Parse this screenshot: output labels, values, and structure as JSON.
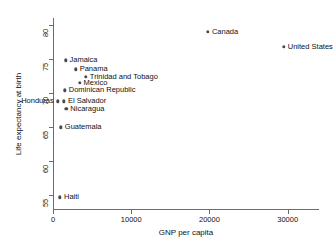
{
  "chart_data": {
    "type": "scatter",
    "title": "",
    "xlabel": "GNP per capita",
    "ylabel": "Life expectancy at birth",
    "xlim": [
      0,
      34000
    ],
    "ylim": [
      53,
      81
    ],
    "grid": false,
    "legend": "none",
    "xticks": [
      {
        "value": 0,
        "label": "0"
      },
      {
        "value": 10000,
        "label": "10000"
      },
      {
        "value": 20000,
        "label": "20000"
      },
      {
        "value": 30000,
        "label": "30000"
      }
    ],
    "yticks": [
      {
        "value": 55,
        "label": "55"
      },
      {
        "value": 60,
        "label": "60"
      },
      {
        "value": 65,
        "label": "65"
      },
      {
        "value": 70,
        "label": "70"
      },
      {
        "value": 75,
        "label": "75"
      },
      {
        "value": 80,
        "label": "80"
      }
    ],
    "points": [
      {
        "label": "Canada",
        "x": 19800,
        "y": 79.0,
        "label_side": "right"
      },
      {
        "label": "United States",
        "x": 29500,
        "y": 76.8,
        "label_side": "right"
      },
      {
        "label": "Jamaica",
        "x": 1600,
        "y": 74.8,
        "label_side": "right"
      },
      {
        "label": "Panama",
        "x": 2900,
        "y": 73.5,
        "label_side": "right"
      },
      {
        "label": "Trinidad and Tobago",
        "x": 4200,
        "y": 72.4,
        "label_side": "right"
      },
      {
        "label": "Mexico",
        "x": 3400,
        "y": 71.5,
        "label_side": "right"
      },
      {
        "label": "Dominican Republic",
        "x": 1500,
        "y": 70.4,
        "label_side": "right"
      },
      {
        "label": "Honduras",
        "x": 600,
        "y": 68.8,
        "label_side": "left"
      },
      {
        "label": "El Salvador",
        "x": 1400,
        "y": 68.8,
        "label_side": "right"
      },
      {
        "label": "Nicaragua",
        "x": 1700,
        "y": 67.7,
        "label_side": "right"
      },
      {
        "label": "Guatemala",
        "x": 1000,
        "y": 65.0,
        "label_side": "right"
      },
      {
        "label": "Haiti",
        "x": 900,
        "y": 54.7,
        "label_side": "right"
      }
    ]
  }
}
